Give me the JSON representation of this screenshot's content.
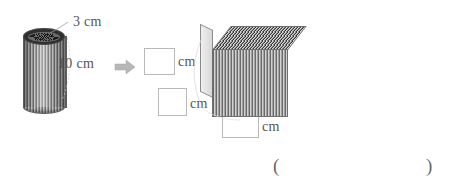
{
  "figure": {
    "background_color": "#ffffff",
    "ink_color": "#555555"
  },
  "cylinder": {
    "name": "ribbed-cylinder",
    "diameter_label": "3 cm",
    "height_label": "10 cm",
    "diameter_value": 3,
    "height_value": 10,
    "unit": "cm"
  },
  "arrow": {
    "name": "transform-arrow",
    "glyph": "right-arrow",
    "color": "#b0b0b0"
  },
  "answers": {
    "boxes": [
      {
        "id": "answer-box-1",
        "value": "",
        "unit": "cm"
      },
      {
        "id": "answer-box-2",
        "value": "",
        "unit": "cm"
      },
      {
        "id": "answer-box-3",
        "value": "",
        "unit": "cm"
      }
    ],
    "unit_labels": {
      "first": "cm",
      "second": "cm",
      "third": "cm"
    }
  },
  "prism": {
    "name": "rectangular-prism",
    "description": "stacked-sheets rectangular prism"
  },
  "answer_line": {
    "open_paren": "(",
    "close_paren": ")",
    "value": ""
  }
}
